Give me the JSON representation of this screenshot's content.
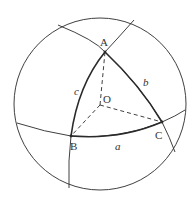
{
  "figure": {
    "labels": {
      "A": "A",
      "B": "B",
      "C": "C",
      "O": "O",
      "a": "a",
      "b": "b",
      "c": "c"
    },
    "colors": {
      "stroke": "#2a2a2a",
      "background": "#ffffff"
    }
  }
}
